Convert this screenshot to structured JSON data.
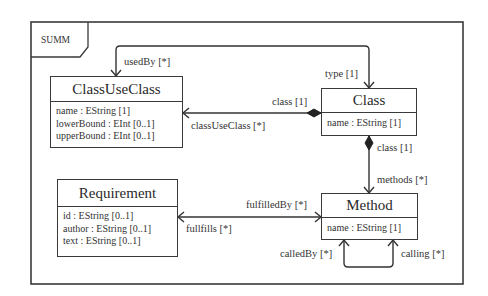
{
  "diagram": {
    "frame": {
      "label": "SUMM"
    },
    "classes": [
      {
        "id": "classuseclass",
        "name": "ClassUseClass",
        "attributes": [
          "name : EString [1]",
          "lowerBound : EInt [0..1]",
          "upperBound : EInt [0..1]"
        ]
      },
      {
        "id": "class",
        "name": "Class",
        "attributes": [
          "name : EString [1]"
        ]
      },
      {
        "id": "requirement",
        "name": "Requirement",
        "attributes": [
          "id : EString [0..1]",
          "author : EString [0..1]",
          "text : EString [0..1]"
        ]
      },
      {
        "id": "method",
        "name": "Method",
        "attributes": [
          "name : EString [1]"
        ]
      }
    ],
    "associations": [
      {
        "from": "ClassUseClass",
        "to": "Class",
        "source_role": "usedBy [*]",
        "target_role": "type [1]"
      },
      {
        "from": "Class",
        "to": "ClassUseClass",
        "kind": "composition",
        "source_role": "class [1]",
        "target_role": "classUseClass [*]"
      },
      {
        "from": "Class",
        "to": "Method",
        "kind": "composition",
        "source_role": "class [1]",
        "target_role": "methods [*]"
      },
      {
        "from": "Requirement",
        "to": "Method",
        "source_role": "fullfills [*]",
        "target_role": "fulfilledBy [*]"
      },
      {
        "from": "Method",
        "to": "Method",
        "source_role": "calledBy [*]",
        "target_role": "calling [*]"
      }
    ]
  }
}
